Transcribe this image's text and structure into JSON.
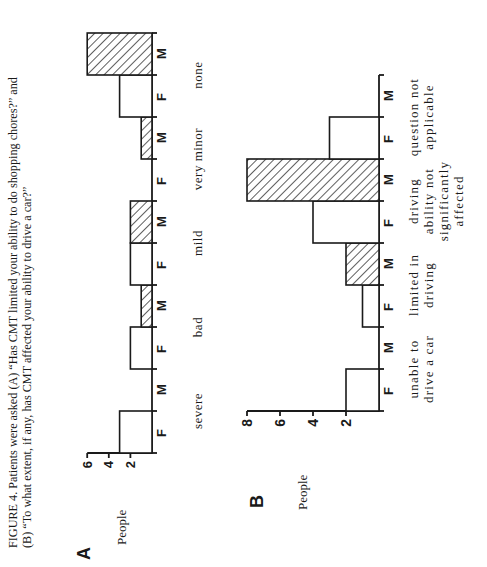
{
  "caption": {
    "line1": "FIGURE 4. Patients were asked (A) “Has CMT limited your ability to do shopping chores?” and",
    "line2": "(B) “To what extent, if any, has CMT affected your ability to drive a car?”"
  },
  "colors": {
    "ink": "#1a1a1a",
    "background": "#ffffff"
  },
  "chart_data": [
    {
      "type": "bar",
      "panel": "A",
      "title": "Has CMT limited your ability to do shopping chores?",
      "ylabel": "People",
      "xlabel": "",
      "yticks": [
        2,
        4,
        6
      ],
      "ylim": [
        0,
        6
      ],
      "categories": [
        "severe",
        "bad",
        "mild",
        "very minor",
        "none"
      ],
      "series": [
        {
          "name": "F",
          "pattern": "open",
          "values": [
            3,
            2,
            2,
            0,
            3
          ]
        },
        {
          "name": "M",
          "pattern": "hatched",
          "values": [
            0,
            1,
            2,
            1,
            6
          ]
        }
      ],
      "grid": false,
      "orientation": "rotated 90° counter-clockwise"
    },
    {
      "type": "bar",
      "panel": "B",
      "title": "To what extent, if any, has CMT affected your ability to drive a car?",
      "ylabel": "People",
      "xlabel": "",
      "yticks": [
        2,
        4,
        6,
        8
      ],
      "ylim": [
        0,
        8
      ],
      "categories": [
        "unable to drive a car",
        "limited in driving",
        "driving ability not significantly affected",
        "question not applicable"
      ],
      "series": [
        {
          "name": "F",
          "pattern": "open",
          "values": [
            2,
            1,
            4,
            3
          ]
        },
        {
          "name": "M",
          "pattern": "hatched",
          "values": [
            0,
            2,
            8,
            0
          ]
        }
      ],
      "grid": false,
      "orientation": "rotated 90° counter-clockwise"
    }
  ],
  "panelA": {
    "label": "A",
    "ylabel": "People",
    "ticks": [
      "2",
      "4",
      "6"
    ],
    "sex_labels": [
      "F",
      "M",
      "F",
      "M",
      "F",
      "M",
      "F",
      "M",
      "F",
      "M"
    ],
    "category_labels": [
      "severe",
      "bad",
      "mild",
      "very minor",
      "none"
    ]
  },
  "panelB": {
    "label": "B",
    "ylabel": "People",
    "ticks": [
      "2",
      "4",
      "6",
      "8"
    ],
    "sex_labels": [
      "F",
      "M",
      "F",
      "M",
      "F",
      "M",
      "F",
      "M"
    ],
    "category_labels": [
      [
        "unable to",
        "drive a car"
      ],
      [
        "limited in",
        "driving"
      ],
      [
        "driving",
        "ability not",
        "significantly",
        "affected"
      ],
      [
        "question not",
        "applicable"
      ]
    ]
  }
}
